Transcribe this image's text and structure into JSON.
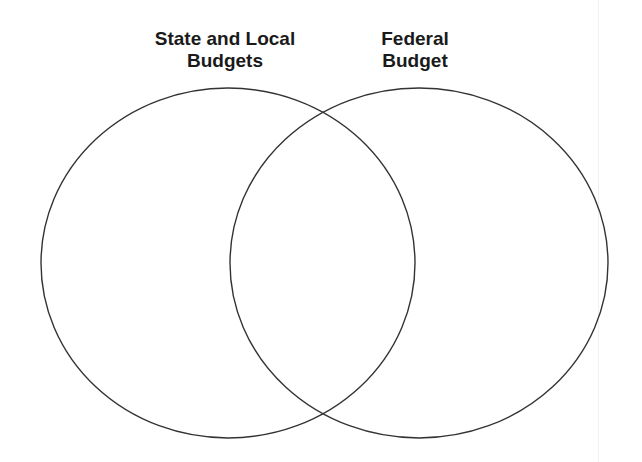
{
  "diagram": {
    "type": "venn",
    "sets": [
      {
        "label_lines": [
          "State and Local",
          "Budgets"
        ],
        "cx": 228,
        "cy": 263,
        "rx": 187,
        "ry": 175
      },
      {
        "label_lines": [
          "Federal",
          "Budget"
        ],
        "cx": 419,
        "cy": 263,
        "rx": 189,
        "ry": 175
      }
    ],
    "stroke_color": "#333333"
  }
}
